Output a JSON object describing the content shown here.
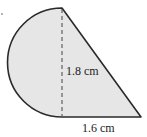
{
  "diagram": {
    "shape": "semicircle-plus-right-triangle",
    "fill_color": "#e6e6e6",
    "stroke_color": "#2a2a2a",
    "labels": {
      "height": "1.8 cm",
      "base": "1.6 cm"
    }
  }
}
